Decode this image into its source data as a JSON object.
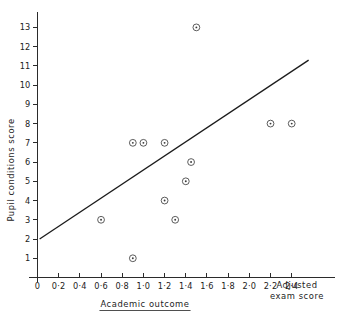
{
  "chart_data": {
    "type": "scatter",
    "title": "",
    "xlabel": "Academic outcome",
    "xlabel_secondary_line1": "Adjusted",
    "xlabel_secondary_line2": "exam score",
    "ylabel": "Pupil conditions score",
    "xlim": [
      0,
      2.62
    ],
    "ylim": [
      0,
      13.8
    ],
    "grid": false,
    "legend": null,
    "x_ticks": [
      {
        "value": 0,
        "label": "0"
      },
      {
        "value": 0.2,
        "label": "0·2"
      },
      {
        "value": 0.4,
        "label": "0·4"
      },
      {
        "value": 0.6,
        "label": "0·6"
      },
      {
        "value": 0.8,
        "label": "0·8"
      },
      {
        "value": 1.0,
        "label": "1·0"
      },
      {
        "value": 1.2,
        "label": "1·2"
      },
      {
        "value": 1.4,
        "label": "1·4"
      },
      {
        "value": 1.6,
        "label": "1·6"
      },
      {
        "value": 1.8,
        "label": "1·8"
      },
      {
        "value": 2.0,
        "label": "2·0"
      },
      {
        "value": 2.2,
        "label": "2·2"
      },
      {
        "value": 2.4,
        "label": "2·4"
      }
    ],
    "y_ticks": [
      {
        "value": 1,
        "label": "1"
      },
      {
        "value": 2,
        "label": "2"
      },
      {
        "value": 3,
        "label": "3"
      },
      {
        "value": 4,
        "label": "4"
      },
      {
        "value": 5,
        "label": "5"
      },
      {
        "value": 6,
        "label": "6"
      },
      {
        "value": 7,
        "label": "7"
      },
      {
        "value": 8,
        "label": "8"
      },
      {
        "value": 9,
        "label": "9"
      },
      {
        "value": 10,
        "label": "10"
      },
      {
        "value": 11,
        "label": "11"
      },
      {
        "value": 12,
        "label": "12"
      },
      {
        "value": 13,
        "label": "13"
      }
    ],
    "points": [
      {
        "x": 0.6,
        "y": 3
      },
      {
        "x": 0.9,
        "y": 1
      },
      {
        "x": 0.9,
        "y": 7
      },
      {
        "x": 1.0,
        "y": 7
      },
      {
        "x": 1.2,
        "y": 7
      },
      {
        "x": 1.2,
        "y": 4
      },
      {
        "x": 1.3,
        "y": 3
      },
      {
        "x": 1.4,
        "y": 5
      },
      {
        "x": 1.45,
        "y": 6
      },
      {
        "x": 1.5,
        "y": 13
      },
      {
        "x": 2.2,
        "y": 8
      },
      {
        "x": 2.4,
        "y": 8
      }
    ],
    "fit_line": {
      "x0": 0.02,
      "y0": 2.0,
      "x1": 2.56,
      "y1": 11.3
    },
    "marker_style": "circle-with-center-dot",
    "colors": {
      "axis": "#2b2b2b",
      "line": "#1c1c1c",
      "marker": "#4a4a4a",
      "text": "#222222",
      "background": "#ffffff"
    }
  }
}
